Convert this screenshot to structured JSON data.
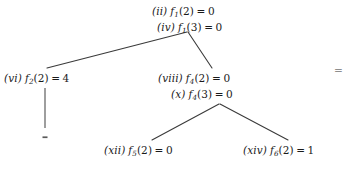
{
  "diagram": {
    "type": "recursion-tree",
    "background_color": "#ffffff",
    "text_color": "#1a1a1a",
    "edge_color": "#3a3a3a",
    "nodes": [
      {
        "id": "root",
        "lines": [
          {
            "tag": "(ii)",
            "fname": "f",
            "subscript": "1",
            "arg": "(2)",
            "eq": "=",
            "value": "0"
          },
          {
            "tag": "(iv)",
            "fname": "f",
            "subscript": "1",
            "arg": "(3)",
            "eq": "=",
            "value": "0"
          }
        ]
      },
      {
        "id": "left",
        "lines": [
          {
            "tag": "(vi)",
            "fname": "f",
            "subscript": "2",
            "arg": "(2)",
            "eq": "=",
            "value": "4"
          }
        ]
      },
      {
        "id": "mid",
        "lines": [
          {
            "tag": "(viii)",
            "fname": "f",
            "subscript": "4",
            "arg": "(2)",
            "eq": "=",
            "value": "0"
          },
          {
            "tag": "(x)",
            "fname": "f",
            "subscript": "4",
            "arg": "(3)",
            "eq": "=",
            "value": "0"
          }
        ]
      },
      {
        "id": "leaf-left",
        "lines": [
          {
            "tag": "(xii)",
            "fname": "f",
            "subscript": "5",
            "arg": "(2)",
            "eq": "=",
            "value": "0"
          }
        ]
      },
      {
        "id": "leaf-right",
        "lines": [
          {
            "tag": "(xiv)",
            "fname": "f",
            "subscript": "6",
            "arg": "(2)",
            "eq": "=",
            "value": "1"
          }
        ]
      }
    ],
    "trailing_symbol": "=",
    "edges": [
      {
        "from": "root",
        "to": "left",
        "x1": 187,
        "y1": 32,
        "x2": 47,
        "y2": 68
      },
      {
        "from": "root",
        "to": "mid",
        "x1": 188,
        "y1": 32,
        "x2": 212,
        "y2": 68
      },
      {
        "from": "left",
        "to": "left-stub",
        "x1": 45,
        "y1": 88,
        "x2": 45,
        "y2": 128
      },
      {
        "from": "mid",
        "to": "leaf-left",
        "x1": 219,
        "y1": 104,
        "x2": 152,
        "y2": 140
      },
      {
        "from": "mid",
        "to": "leaf-right",
        "x1": 220,
        "y1": 104,
        "x2": 288,
        "y2": 140
      }
    ],
    "stub_mark": {
      "x": 43,
      "y": 137,
      "width": 5,
      "height": 1.6
    }
  }
}
